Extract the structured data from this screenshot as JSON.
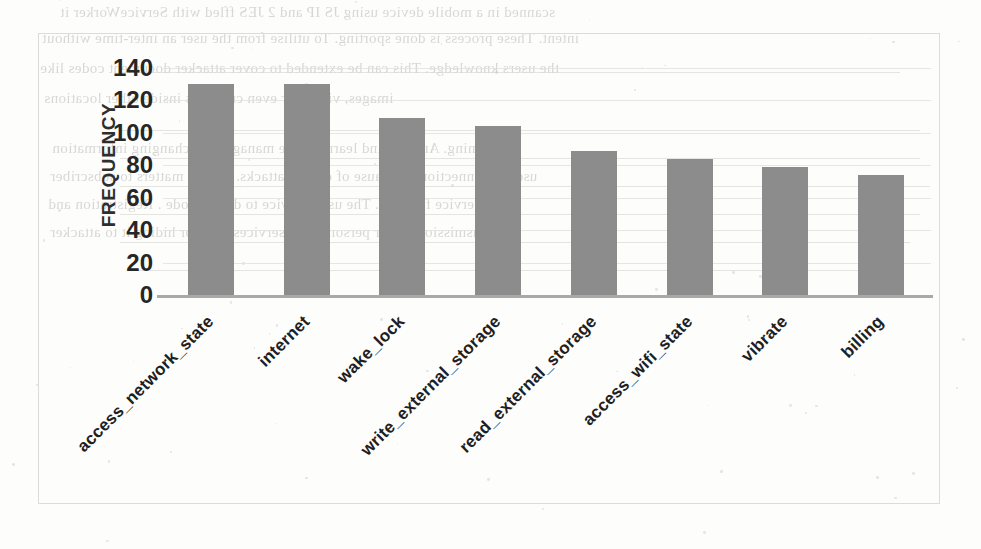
{
  "chart_data": {
    "type": "bar",
    "title": "",
    "xlabel": "",
    "ylabel": "FREQUENCY",
    "ylim": [
      0,
      140
    ],
    "yticks": [
      140,
      120,
      100,
      80,
      60,
      40,
      20,
      0
    ],
    "grid": true,
    "legend": "none",
    "bar_color": "#8c8c8c",
    "categories": [
      "access_network_state",
      "internet",
      "wake_lock",
      "write_external_storage",
      "read_external_storage",
      "access_wifi_state",
      "vibrate",
      "billing"
    ],
    "values": [
      130,
      130,
      109,
      104,
      89,
      84,
      79,
      74
    ]
  },
  "axes": {
    "y_title": "FREQUENCY",
    "y_tick_labels": [
      "140",
      "120",
      "100",
      "80",
      "60",
      "40",
      "20",
      "0"
    ]
  },
  "scan_background": {
    "lines": [
      {
        "text": "scanned in a mobile device using JS IP and 2 JES ffled with ServiceWorker it",
        "top": 4,
        "left": 60,
        "size": 15
      },
      {
        "text": "intent.  These process is done sporting. To utilise from the user an inter-time without",
        "top": 30,
        "left": 42,
        "size": 15
      },
      {
        "text": "the users knowledge. This can be extended to cover attacker document codes like",
        "top": 60,
        "left": 40,
        "size": 15
      },
      {
        "text": "images, videos or even creations inside other locations",
        "top": 90,
        "left": 44,
        "size": 15
      },
      {
        "text": "obtaining. An files and learning site management changing information",
        "top": 140,
        "left": 52,
        "size": 15
      },
      {
        "text": "users a connection can cause of certain attacks.  Source matters to subscriber",
        "top": 168,
        "left": 50,
        "size": 15
      },
      {
        "text": "service filtering. The using device to device code .  Registration and",
        "top": 196,
        "left": 48,
        "size": 15
      },
      {
        "text": "transmission of our personal and services data for hiding it to attacker",
        "top": 224,
        "left": 50,
        "size": 15
      }
    ],
    "rules": [
      {
        "top": 72,
        "left": 140,
        "width": 760
      },
      {
        "top": 130,
        "left": 120,
        "width": 800
      },
      {
        "top": 158,
        "left": 120,
        "width": 800
      },
      {
        "top": 186,
        "left": 120,
        "width": 810
      },
      {
        "top": 214,
        "left": 120,
        "width": 800
      },
      {
        "top": 242,
        "left": 120,
        "width": 790
      },
      {
        "top": 270,
        "left": 130,
        "width": 770
      }
    ]
  }
}
